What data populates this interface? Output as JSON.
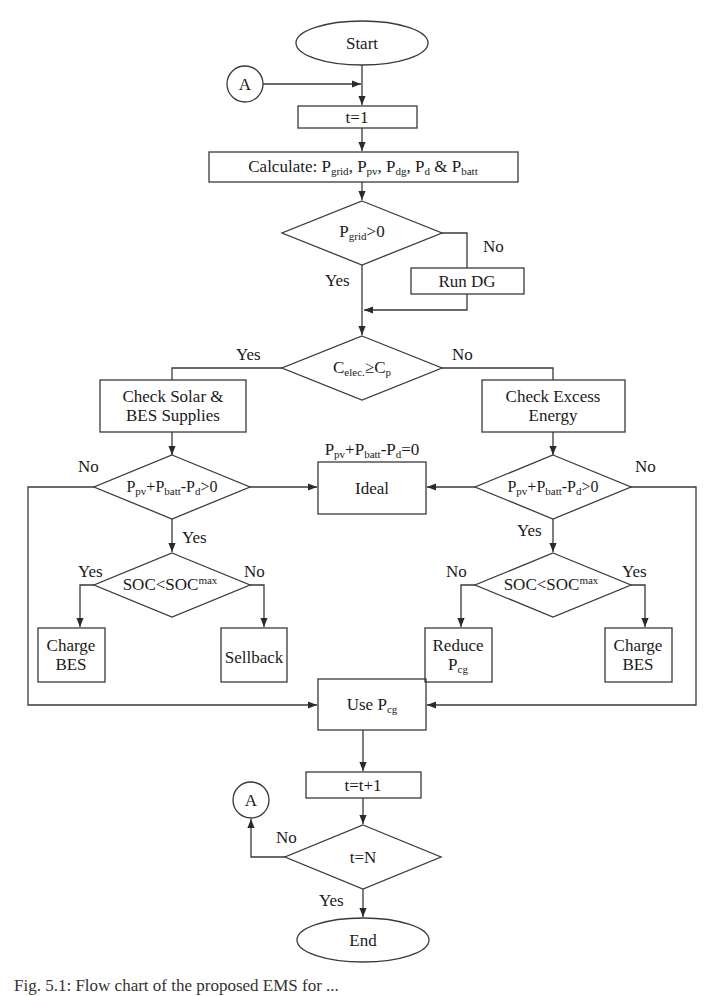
{
  "diagram": {
    "type": "flowchart",
    "colors": {
      "stroke": "#3a3a3a",
      "text": "#1a1a1a",
      "background": "#ffffff"
    },
    "nodes": {
      "start": {
        "shape": "ellipse",
        "label": "Start"
      },
      "connector_top": {
        "shape": "circle",
        "label": "A"
      },
      "init_t": {
        "shape": "rect",
        "label": "t=1"
      },
      "calculate": {
        "shape": "rect",
        "prefix": "Calculate: ",
        "items": [
          {
            "base": "P",
            "sub": "grid",
            "sep": ", "
          },
          {
            "base": "P",
            "sub": "pv",
            "sep": ", "
          },
          {
            "base": "P",
            "sub": "dg",
            "sep": ", "
          },
          {
            "base": "P",
            "sub": "d",
            "sep": " & "
          },
          {
            "base": "P",
            "sub": "batt",
            "sep": ""
          }
        ],
        "label": "Calculate: Pgrid, Ppv, Pdg, Pd & Pbatt"
      },
      "grid_check": {
        "shape": "diamond",
        "base": "P",
        "sub": "grid",
        "rest": ">0",
        "label": "Pgrid>0"
      },
      "run_dg": {
        "shape": "rect",
        "label": "Run DG"
      },
      "cost_check": {
        "shape": "diamond",
        "base": "C",
        "sub": "elec.",
        "mid": "≥C",
        "sub2": "p",
        "label": "Celec.≥Cp"
      },
      "check_solar": {
        "shape": "rect",
        "line1": "Check Solar &",
        "line2": "BES Supplies"
      },
      "check_excess": {
        "shape": "rect",
        "line1": "Check Excess",
        "line2": "Energy"
      },
      "balance_left": {
        "shape": "diamond",
        "label": "Ppv+Pbatt-Pd>0",
        "p1": "P",
        "s1": "pv",
        "p2": "+P",
        "s2": "batt",
        "p3": "-P",
        "s3": "d",
        "rest": ">0"
      },
      "balance_right": {
        "shape": "diamond",
        "label": "Ppv+Pbatt-Pd>0",
        "p1": "P",
        "s1": "pv",
        "p2": "+P",
        "s2": "batt",
        "p3": "-P",
        "s3": "d",
        "rest": ">0"
      },
      "ideal": {
        "shape": "rect",
        "label": "Ideal",
        "note": {
          "p1": "P",
          "s1": "pv",
          "p2": "+P",
          "s2": "batt",
          "p3": "-P",
          "s3": "d",
          "rest": "=0",
          "label": "Ppv+Pbatt-Pd=0"
        }
      },
      "soc_left": {
        "shape": "diamond",
        "base": "SOC<SOC",
        "sup": "max",
        "label": "SOC<SOCmax"
      },
      "soc_right": {
        "shape": "diamond",
        "base": "SOC<SOC",
        "sup": "max",
        "label": "SOC<SOCmax"
      },
      "charge_bes_left": {
        "shape": "rect",
        "line1": "Charge",
        "line2": "BES"
      },
      "sellback": {
        "shape": "rect",
        "label": "Sellback"
      },
      "reduce_pcg": {
        "shape": "rect",
        "line1": "Reduce",
        "base": "P",
        "sub": "cg",
        "label": "Reduce Pcg"
      },
      "charge_bes_right": {
        "shape": "rect",
        "line1": "Charge",
        "line2": "BES"
      },
      "use_pcg": {
        "shape": "rect",
        "prefix": "Use ",
        "base": "P",
        "sub": "cg",
        "label": "Use Pcg"
      },
      "increment_t": {
        "shape": "rect",
        "label": "t=t+1"
      },
      "end_check": {
        "shape": "diamond",
        "label": "t=N"
      },
      "connector_bottom": {
        "shape": "circle",
        "label": "A"
      },
      "end": {
        "shape": "ellipse",
        "label": "End"
      }
    },
    "edge_labels": {
      "grid_no": "No",
      "grid_yes": "Yes",
      "cost_yes": "Yes",
      "cost_no": "No",
      "left_bal_no": "No",
      "left_bal_yes": "Yes",
      "right_bal_no": "No",
      "right_bal_yes": "Yes",
      "left_soc_yes": "Yes",
      "left_soc_no": "No",
      "right_soc_no": "No",
      "right_soc_yes": "Yes",
      "end_no": "No",
      "end_yes": "Yes"
    },
    "edges": [
      [
        "start",
        "init_t"
      ],
      [
        "connector_top",
        "init_t"
      ],
      [
        "init_t",
        "calculate"
      ],
      [
        "calculate",
        "grid_check"
      ],
      [
        "grid_check",
        "cost_check",
        "Yes"
      ],
      [
        "grid_check",
        "run_dg",
        "No"
      ],
      [
        "run_dg",
        "cost_check"
      ],
      [
        "cost_check",
        "check_solar",
        "Yes"
      ],
      [
        "cost_check",
        "check_excess",
        "No"
      ],
      [
        "check_solar",
        "balance_left"
      ],
      [
        "check_excess",
        "balance_right"
      ],
      [
        "balance_left",
        "ideal"
      ],
      [
        "balance_right",
        "ideal"
      ],
      [
        "balance_left",
        "soc_left",
        "Yes"
      ],
      [
        "balance_left",
        "use_pcg",
        "No"
      ],
      [
        "balance_right",
        "soc_right",
        "Yes"
      ],
      [
        "balance_right",
        "use_pcg",
        "No"
      ],
      [
        "soc_left",
        "charge_bes_left",
        "Yes"
      ],
      [
        "soc_left",
        "sellback",
        "No"
      ],
      [
        "soc_right",
        "reduce_pcg",
        "No"
      ],
      [
        "soc_right",
        "charge_bes_right",
        "Yes"
      ],
      [
        "use_pcg",
        "increment_t"
      ],
      [
        "increment_t",
        "end_check"
      ],
      [
        "end_check",
        "connector_bottom",
        "No"
      ],
      [
        "end_check",
        "end",
        "Yes"
      ]
    ]
  },
  "caption": {
    "text": "Fig. 5.1: Flow chart of the proposed EMS for ..."
  }
}
